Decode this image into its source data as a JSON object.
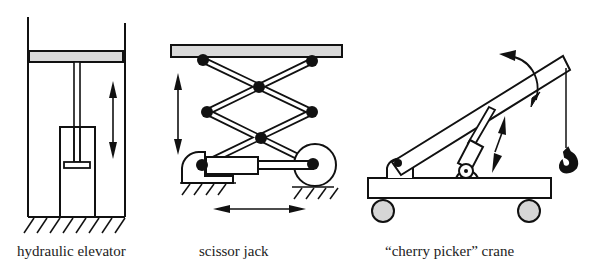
{
  "figure": {
    "panels": [
      {
        "id": "hydraulic-elevator",
        "caption": "hydraulic elevator"
      },
      {
        "id": "scissor-jack",
        "caption": "scissor jack"
      },
      {
        "id": "cherry-picker-crane",
        "caption": "“cherry picker” crane"
      }
    ]
  },
  "colors": {
    "stroke": "#111111",
    "platform_fill": "#d9d9d9",
    "wheel_fill": "#d6d6d6",
    "joint_fill": "#111111",
    "background": "#ffffff"
  }
}
